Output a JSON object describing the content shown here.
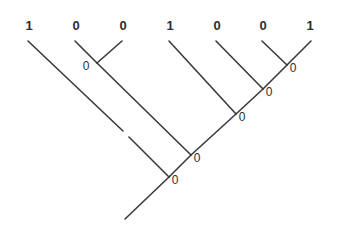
{
  "figure": {
    "type": "cladogram",
    "width": 337,
    "height": 228,
    "background_color": "#ffffff",
    "line_color": "#3a3a3a",
    "text_color": "#2e2e2e",
    "line_width": 1.6
  },
  "chart_data": {
    "type": "diagram",
    "title": "",
    "subtitle": "",
    "xlabel": "",
    "ylabel": "",
    "legend": [],
    "grid": false,
    "leaf_states": [
      "1",
      "0",
      "0",
      "1",
      "0",
      "0",
      "1"
    ],
    "internal_states": [
      "0",
      "0",
      "0",
      "0",
      "0",
      "0"
    ],
    "leaves": [
      {
        "id": "leaf-1",
        "state": "1",
        "label_x": 29,
        "label_y": 25,
        "tip_x": 28,
        "tip_y": 41
      },
      {
        "id": "leaf-2",
        "state": "0",
        "label_x": 76,
        "label_y": 25,
        "tip_x": 75,
        "tip_y": 41
      },
      {
        "id": "leaf-3",
        "state": "0",
        "label_x": 123,
        "label_y": 25,
        "tip_x": 122,
        "tip_y": 41
      },
      {
        "id": "leaf-4",
        "state": "1",
        "label_x": 170,
        "label_y": 25,
        "tip_x": 169,
        "tip_y": 41
      },
      {
        "id": "leaf-5",
        "state": "0",
        "label_x": 217,
        "label_y": 25,
        "tip_x": 216,
        "tip_y": 41
      },
      {
        "id": "leaf-6",
        "state": "0",
        "label_x": 263,
        "label_y": 25,
        "tip_x": 262,
        "tip_y": 41
      },
      {
        "id": "leaf-7",
        "state": "1",
        "label_x": 310,
        "label_y": 25,
        "tip_x": 311,
        "tip_y": 41
      }
    ],
    "nodes": [
      {
        "id": "node-a",
        "state": "0",
        "x": 97,
        "y": 63,
        "label_x": 86,
        "label_y": 66,
        "label_side": "left"
      },
      {
        "id": "node-g",
        "state": "0",
        "x": 287,
        "y": 65,
        "label_x": 293,
        "label_y": 68,
        "label_side": "right"
      },
      {
        "id": "node-f",
        "state": "0",
        "x": 263,
        "y": 89,
        "label_x": 269,
        "label_y": 92,
        "label_side": "right"
      },
      {
        "id": "node-e",
        "state": "0",
        "x": 236,
        "y": 114,
        "label_x": 242,
        "label_y": 117,
        "label_side": "right"
      },
      {
        "id": "node-d",
        "state": "0",
        "x": 191,
        "y": 155,
        "label_x": 197,
        "label_y": 158,
        "label_side": "right"
      },
      {
        "id": "node-c",
        "state": "0",
        "x": 169,
        "y": 177,
        "label_x": 175,
        "label_y": 180,
        "label_side": "right"
      }
    ],
    "branches": [
      {
        "id": "branch-leaf1",
        "from": [
          28,
          41
        ],
        "to": [
          123,
          131
        ],
        "note": "long branch from leaf 1, broken by a small gap"
      },
      {
        "id": "branch-leaf1-lower",
        "from": [
          129,
          137
        ],
        "to": [
          169,
          177
        ]
      },
      {
        "id": "branch-leaf2",
        "from": [
          75,
          41
        ],
        "to": [
          97,
          63
        ]
      },
      {
        "id": "branch-leaf3",
        "from": [
          122,
          41
        ],
        "to": [
          97,
          63
        ]
      },
      {
        "id": "branch-nodea",
        "from": [
          97,
          63
        ],
        "to": [
          191,
          155
        ]
      },
      {
        "id": "branch-leaf4",
        "from": [
          169,
          41
        ],
        "to": [
          236,
          114
        ]
      },
      {
        "id": "branch-leaf5",
        "from": [
          216,
          41
        ],
        "to": [
          263,
          89
        ]
      },
      {
        "id": "branch-leaf6",
        "from": [
          262,
          41
        ],
        "to": [
          287,
          65
        ]
      },
      {
        "id": "branch-leaf7",
        "from": [
          311,
          41
        ],
        "to": [
          287,
          65
        ]
      },
      {
        "id": "branch-nodeg",
        "from": [
          287,
          65
        ],
        "to": [
          263,
          89
        ]
      },
      {
        "id": "branch-nodef",
        "from": [
          263,
          89
        ],
        "to": [
          236,
          114
        ]
      },
      {
        "id": "branch-nodee",
        "from": [
          236,
          114
        ],
        "to": [
          191,
          155
        ]
      },
      {
        "id": "branch-noded",
        "from": [
          191,
          155
        ],
        "to": [
          169,
          177
        ]
      },
      {
        "id": "branch-root",
        "from": [
          169,
          177
        ],
        "to": [
          125,
          219
        ]
      }
    ]
  }
}
